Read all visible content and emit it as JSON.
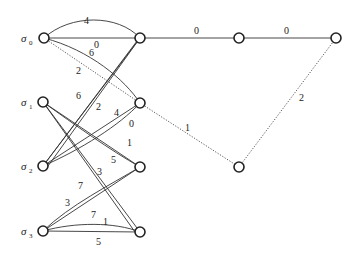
{
  "diagram": {
    "type": "weighted-graph",
    "nodes": [
      {
        "id": "s0",
        "label": "σ",
        "sub": "0",
        "x": 44,
        "y": 38
      },
      {
        "id": "s1",
        "label": "σ",
        "sub": "1",
        "x": 43,
        "y": 102
      },
      {
        "id": "s2",
        "label": "σ",
        "sub": "2",
        "x": 43,
        "y": 166
      },
      {
        "id": "s3",
        "label": "σ",
        "sub": "3",
        "x": 43,
        "y": 231
      },
      {
        "id": "A",
        "label": "",
        "x": 140,
        "y": 38
      },
      {
        "id": "B",
        "label": "",
        "x": 140,
        "y": 103
      },
      {
        "id": "C",
        "label": "",
        "x": 140,
        "y": 167
      },
      {
        "id": "D",
        "label": "",
        "x": 140,
        "y": 232
      },
      {
        "id": "G",
        "label": "",
        "x": 239,
        "y": 38
      },
      {
        "id": "F",
        "label": "",
        "x": 336,
        "y": 38
      },
      {
        "id": "E",
        "label": "",
        "x": 239,
        "y": 167
      }
    ],
    "edges": [
      {
        "from": "s0",
        "to": "A",
        "weight": "4",
        "style": "solid",
        "curve": "arc-top"
      },
      {
        "from": "s0",
        "to": "A",
        "weight": "0",
        "style": "solid"
      },
      {
        "from": "s0",
        "to": "B",
        "weight": "6",
        "style": "solid",
        "curve": "bend"
      },
      {
        "from": "s0",
        "to": "B",
        "weight": "2",
        "style": "dotted"
      },
      {
        "from": "s2",
        "to": "A",
        "weight": "6",
        "style": "solid"
      },
      {
        "from": "s2",
        "to": "A",
        "weight": "2",
        "style": "solid"
      },
      {
        "from": "s2",
        "to": "B",
        "weight": "4",
        "style": "solid"
      },
      {
        "from": "s2",
        "to": "B",
        "weight": "0",
        "style": "solid"
      },
      {
        "from": "s1",
        "to": "C",
        "weight": "1",
        "style": "solid"
      },
      {
        "from": "s1",
        "to": "C",
        "weight": "5",
        "style": "solid"
      },
      {
        "from": "s1",
        "to": "D",
        "weight": "3",
        "style": "solid"
      },
      {
        "from": "s1",
        "to": "D",
        "weight": "7",
        "style": "solid"
      },
      {
        "from": "s3",
        "to": "C",
        "weight": "3",
        "style": "solid"
      },
      {
        "from": "s3",
        "to": "C",
        "weight": "7",
        "style": "solid"
      },
      {
        "from": "s3",
        "to": "D",
        "weight": "1",
        "style": "solid",
        "curve": "bend"
      },
      {
        "from": "s3",
        "to": "D",
        "weight": "5",
        "style": "solid"
      },
      {
        "from": "A",
        "to": "G",
        "weight": "0",
        "style": "solid"
      },
      {
        "from": "G",
        "to": "F",
        "weight": "0",
        "style": "solid"
      },
      {
        "from": "B",
        "to": "E",
        "weight": "1",
        "style": "dotted"
      },
      {
        "from": "E",
        "to": "F",
        "weight": "2",
        "style": "dotted"
      }
    ]
  },
  "labels": {
    "s0": "σ",
    "s0_sub": "0",
    "s1": "σ",
    "s1_sub": "1",
    "s2": "σ",
    "s2_sub": "2",
    "s3": "σ",
    "s3_sub": "3",
    "w_s0A_arc": "4",
    "w_s0A": "0",
    "w_s0B_bend": "6",
    "w_s0B_dot": "2",
    "w_s2A_a": "6",
    "w_s2A_b": "2",
    "w_s2B_a": "4",
    "w_s2B_b": "0",
    "w_s1C_a": "1",
    "w_s1C_b": "5",
    "w_s1D_a": "3",
    "w_s1D_b": "7",
    "w_s3C_a": "3",
    "w_s3C_b": "7",
    "w_s3D_bend": "1",
    "w_s3D": "5",
    "w_AG": "0",
    "w_GF": "0",
    "w_BE": "1",
    "w_EF": "2"
  }
}
